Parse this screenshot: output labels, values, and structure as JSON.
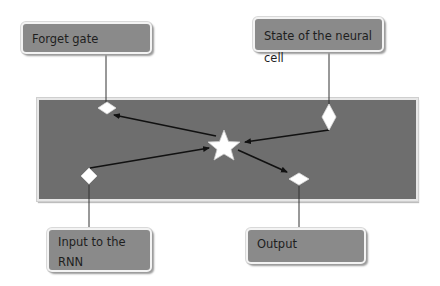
{
  "diagram": {
    "title": "",
    "labels": {
      "forget_gate": "Forget gate",
      "state": "State of the neural cell",
      "input_line1": "Input to the",
      "input_line2": "RNN",
      "output": "Output"
    },
    "colors": {
      "label_fill": "#8a8a8a",
      "main_fill": "#6e6e6e",
      "shape_fill": "#ffffff",
      "line": "#111111"
    },
    "nodes": [
      {
        "id": "center",
        "shape": "star"
      },
      {
        "id": "forget",
        "shape": "diamond"
      },
      {
        "id": "state",
        "shape": "diamond"
      },
      {
        "id": "input",
        "shape": "diamond"
      },
      {
        "id": "output",
        "shape": "diamond"
      }
    ],
    "edges": [
      {
        "from": "center",
        "to": "forget"
      },
      {
        "from": "state",
        "to": "center"
      },
      {
        "from": "input",
        "to": "center"
      },
      {
        "from": "center",
        "to": "output"
      }
    ]
  }
}
